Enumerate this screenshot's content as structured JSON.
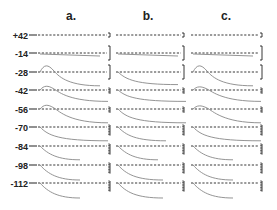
{
  "chart_data": {
    "type": "line",
    "title": "",
    "panels": [
      {
        "label": "a."
      },
      {
        "label": "b."
      },
      {
        "label": "c."
      }
    ],
    "row_labels": [
      "+42",
      "-14",
      "-28",
      "-42",
      "-56",
      "-70",
      "-84",
      "-98",
      "-112"
    ],
    "ylabel": "Membrane potential (mV)",
    "xlabel": "",
    "series": [
      {
        "name": "a.",
        "peak_hump": [
          0,
          0,
          1,
          0.6,
          0.6,
          0,
          0,
          0,
          0
        ],
        "decay_depth": [
          0,
          0.2,
          0.9,
          0.7,
          0.9,
          0.9,
          0.9,
          1.0,
          1.0
        ]
      },
      {
        "name": "b.",
        "peak_hump": [
          0,
          0,
          0,
          0,
          0,
          0,
          0,
          0,
          0
        ],
        "decay_depth": [
          0,
          0.1,
          0.8,
          0.7,
          0.9,
          0.9,
          0.9,
          1.0,
          1.0
        ]
      },
      {
        "name": "c.",
        "peak_hump": [
          0,
          0,
          1,
          0.5,
          0.5,
          0,
          0,
          0,
          0
        ],
        "decay_depth": [
          0,
          0.1,
          0.9,
          0.7,
          0.9,
          0.9,
          0.9,
          1.0,
          1.0
        ]
      }
    ],
    "grid": false,
    "legend": "none"
  },
  "labels": {
    "panel_a": "a.",
    "panel_b": "b.",
    "panel_c": "c.",
    "rows": [
      "+42",
      "-14",
      "-28",
      "-42",
      "-56",
      "-70",
      "-84",
      "-98",
      "-112"
    ]
  },
  "colors": {
    "trace": "#888888",
    "ink": "#222222"
  }
}
